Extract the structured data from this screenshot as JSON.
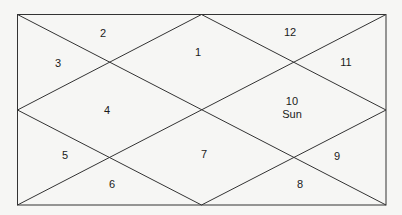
{
  "chart": {
    "style": "north-indian-birth-chart",
    "line_color": "#333333",
    "background": "#f6f6f4",
    "houses": [
      {
        "number": "1",
        "planets": "",
        "x": 198,
        "y": 52
      },
      {
        "number": "2",
        "planets": "",
        "x": 103,
        "y": 33
      },
      {
        "number": "3",
        "planets": "",
        "x": 58,
        "y": 63
      },
      {
        "number": "4",
        "planets": "",
        "x": 107,
        "y": 110
      },
      {
        "number": "5",
        "planets": "",
        "x": 65,
        "y": 155
      },
      {
        "number": "6",
        "planets": "",
        "x": 112,
        "y": 184
      },
      {
        "number": "7",
        "planets": "",
        "x": 204,
        "y": 154
      },
      {
        "number": "8",
        "planets": "",
        "x": 300,
        "y": 184
      },
      {
        "number": "9",
        "planets": "",
        "x": 337,
        "y": 156
      },
      {
        "number": "10",
        "planets": "Sun",
        "x": 292,
        "y": 102
      },
      {
        "number": "11",
        "planets": "",
        "x": 346,
        "y": 62
      },
      {
        "number": "12",
        "planets": "",
        "x": 290,
        "y": 32
      }
    ]
  }
}
